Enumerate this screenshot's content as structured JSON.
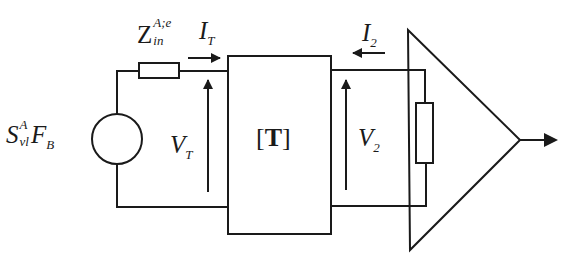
{
  "diagram": {
    "type": "circuit-schematic",
    "colors": {
      "stroke": "#1a1a1a",
      "background": "#ffffff"
    },
    "source": {
      "label_main": "S",
      "label_sup": "A",
      "label_sub": "vl",
      "label_factor": "F",
      "label_factor_sub": "B"
    },
    "input_impedance": {
      "label_main": "Z",
      "label_sup": "A;e",
      "label_sub": "in"
    },
    "current_in": {
      "label_main": "I",
      "label_sub": "T",
      "direction": "right"
    },
    "voltage_in": {
      "label_main": "V",
      "label_sub": "T",
      "direction": "up"
    },
    "two_port": {
      "label_open": "[",
      "label_main": "T",
      "label_close": "]"
    },
    "current_out": {
      "label_main": "I",
      "label_sub": "2",
      "direction": "left"
    },
    "voltage_out": {
      "label_main": "V",
      "label_sub": "2",
      "direction": "up"
    },
    "amplifier": {
      "shape": "triangle",
      "output_direction": "right"
    },
    "load_resistor": {
      "orientation": "vertical"
    }
  }
}
